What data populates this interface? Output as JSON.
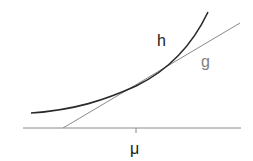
{
  "diagram": {
    "curve_label": "h",
    "tangent_label": "g",
    "axis_tick_label": "μ",
    "colors": {
      "curve": "#2a2a2a",
      "tangent": "#8a8a8a",
      "axis": "#8a8a8a",
      "tangent_label": "#808080",
      "curve_label": "#1a1a1a"
    }
  }
}
